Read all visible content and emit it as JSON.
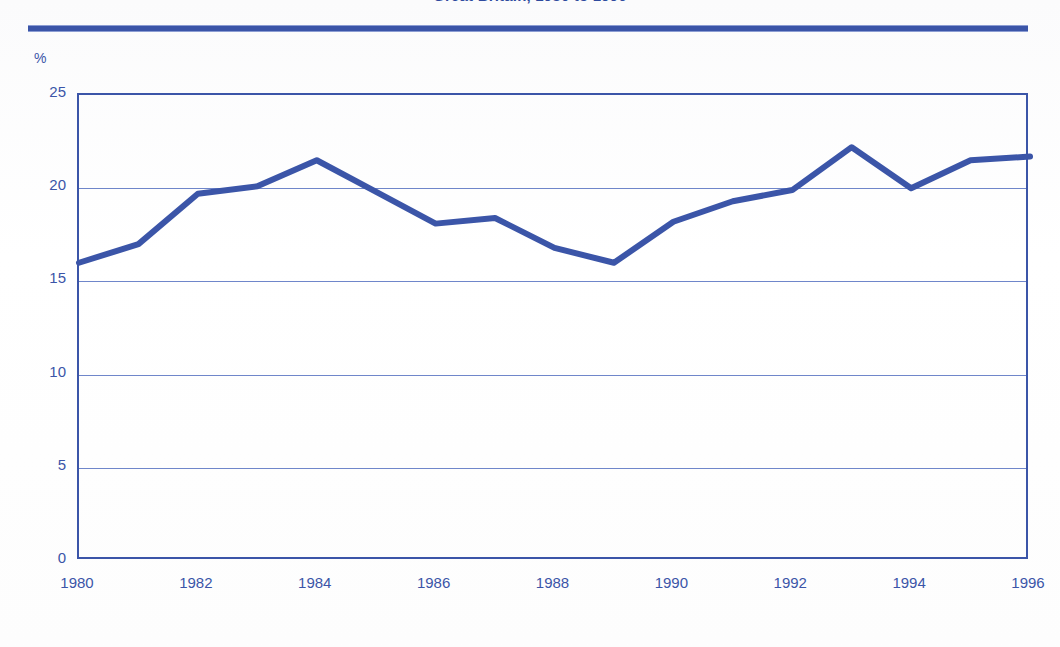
{
  "header": {
    "title": "Great Britain, 1980 to 1996",
    "rule_color": "#3b55a8"
  },
  "axis": {
    "unit_label": "%",
    "y_ticks": [
      "0",
      "5",
      "10",
      "15",
      "20",
      "25"
    ],
    "x_ticks": [
      "1980",
      "1982",
      "1984",
      "1986",
      "1988",
      "1990",
      "1992",
      "1994",
      "1996"
    ]
  },
  "chart_data": {
    "type": "line",
    "title": "Great Britain, 1980 to 1996",
    "xlabel": "",
    "ylabel": "%",
    "ylim": [
      0,
      25
    ],
    "xlim": [
      1980,
      1996
    ],
    "grid": true,
    "legend": "none",
    "line_color": "#3b55a8",
    "line_width": 6,
    "x": [
      1980,
      1981,
      1982,
      1983,
      1984,
      1985,
      1986,
      1987,
      1988,
      1989,
      1990,
      1991,
      1992,
      1993,
      1994,
      1995,
      1996
    ],
    "values": [
      16.0,
      17.0,
      19.7,
      20.1,
      21.5,
      19.8,
      18.1,
      18.4,
      16.8,
      16.0,
      18.2,
      19.3,
      19.9,
      22.2,
      20.0,
      21.5,
      21.7
    ],
    "series": [
      {
        "name": "percentage",
        "values": [
          16.0,
          17.0,
          19.7,
          20.1,
          21.5,
          19.8,
          18.1,
          18.4,
          16.8,
          16.0,
          18.2,
          19.3,
          19.9,
          22.2,
          20.0,
          21.5,
          21.7
        ]
      }
    ],
    "y_tick_values": [
      0,
      5,
      10,
      15,
      20,
      25
    ],
    "x_tick_values": [
      1980,
      1982,
      1984,
      1986,
      1988,
      1990,
      1992,
      1994,
      1996
    ]
  }
}
